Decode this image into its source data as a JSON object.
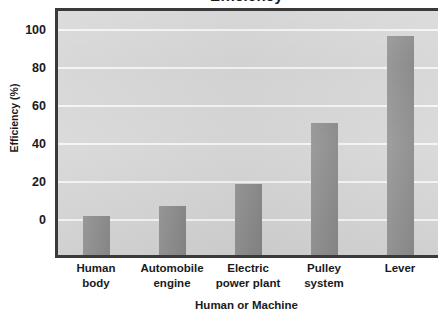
{
  "chart_data": {
    "type": "bar",
    "title": "Efficiency",
    "xlabel": "Human or Machine",
    "ylabel": "Efficiency (%)",
    "categories": [
      "Human body",
      "Automobile engine",
      "Electric power plant",
      "Pulley system",
      "Lever"
    ],
    "category_lines": [
      [
        "Human",
        "body"
      ],
      [
        "Automobile",
        "engine"
      ],
      [
        "Electric",
        "power plant"
      ],
      [
        "Pulley",
        "system"
      ],
      [
        "Lever"
      ]
    ],
    "values": [
      2,
      7.5,
      19,
      51,
      97
    ],
    "ylim": [
      -20,
      110
    ],
    "yticks": [
      0,
      20,
      40,
      60,
      80,
      100
    ],
    "ytick_labels": [
      "0",
      "20",
      "40",
      "60",
      "80",
      "100"
    ],
    "grid": true,
    "grid_axis": "y",
    "legend": null,
    "bar_color": "#8d8d8d",
    "panel_color": "#d6d6d6",
    "gridline_color": "#f4f4f4",
    "frame_color": "#3a3a3a",
    "text_color": "#1a1a1a"
  }
}
